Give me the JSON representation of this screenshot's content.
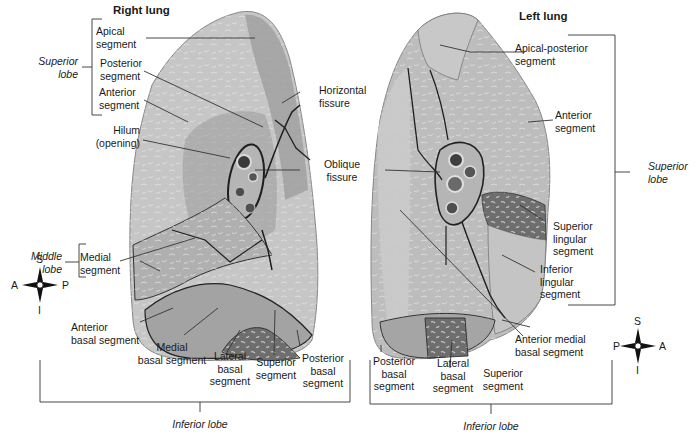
{
  "figure": {
    "colors": {
      "background": "#ffffff",
      "lung_light": "#c9c9c9",
      "lung_mid": "#a9a9a9",
      "lung_dark": "#7a7a7a",
      "fissure": "#222222",
      "leader_line": "#333333"
    },
    "right_lung": {
      "title": "Right lung",
      "lobe_labels": {
        "superior": "Superior\nlobe",
        "middle": "Middle\nlobe",
        "inferior": "Inferior lobe"
      },
      "segments": {
        "apical": "Apical\nsegment",
        "posterior": "Posterior\nsegment",
        "anterior": "Anterior\nsegment",
        "hilum": "Hilum\n(opening)",
        "medial": "Medial\nsegment",
        "anterior_basal": "Anterior\nbasal segment",
        "medial_basal": "Medial\nbasal segment",
        "lateral_basal": "Lateral\nbasal\nsegment",
        "superior": "Superior\nsegment",
        "posterior_basal": "Posterior\nbasal\nsegment"
      },
      "compass": {
        "top": "S",
        "bottom": "I",
        "left": "A",
        "right": "P"
      }
    },
    "fissures": {
      "horizontal": "Horizontal\nfissure",
      "oblique": "Oblique\nfissure"
    },
    "left_lung": {
      "title": "Left lung",
      "lobe_labels": {
        "superior": "Superior\nlobe",
        "inferior": "Inferior lobe"
      },
      "segments": {
        "apical_posterior": "Apical-posterior\nsegment",
        "anterior": "Anterior\nsegment",
        "superior_lingular": "Superior\nlingular\nsegment",
        "inferior_lingular": "Inferior\nlingular\nsegment",
        "anterior_medial_basal": "Anterior medial\nbasal segment",
        "posterior_basal": "Posterior\nbasal\nsegment",
        "lateral_basal": "Lateral\nbasal\nsegment",
        "superior": "Superior\nsegment"
      },
      "compass": {
        "top": "S",
        "bottom": "I",
        "left": "P",
        "right": "A"
      }
    }
  }
}
